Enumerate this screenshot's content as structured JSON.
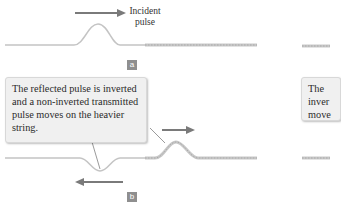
{
  "panel_a": {
    "tag": "a",
    "arrow_label_line1": "Incident",
    "arrow_label_line2": "pulse"
  },
  "panel_b": {
    "tag": "b",
    "callout_text": "The reflected pulse is inverted and a non-inverted transmitted pulse moves on the heavier string."
  },
  "panel_c_partial": {
    "callout_line1": "The",
    "callout_line2": "inver",
    "callout_line3": "move"
  },
  "colors": {
    "string": "#bdbdbd",
    "arrow": "#7a7a7a",
    "tag_bg": "#8f8f8f",
    "callout_bg": "#f0f0f0"
  }
}
